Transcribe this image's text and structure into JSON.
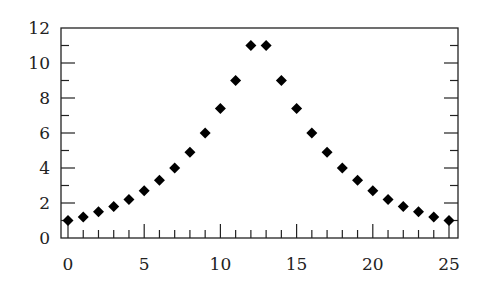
{
  "chart_data": {
    "type": "scatter",
    "title": "",
    "xlabel": "",
    "ylabel": "",
    "marker": "diamond",
    "marker_color": "#000000",
    "x": [
      0,
      1,
      2,
      3,
      4,
      5,
      6,
      7,
      8,
      9,
      10,
      11,
      12,
      13,
      14,
      15,
      16,
      17,
      18,
      19,
      20,
      21,
      22,
      23,
      24,
      25
    ],
    "y": [
      1.0,
      1.2,
      1.5,
      1.8,
      2.2,
      2.7,
      3.3,
      4.0,
      4.9,
      6.0,
      7.4,
      9.0,
      11.0,
      11.0,
      9.0,
      7.4,
      6.0,
      4.9,
      4.0,
      3.3,
      2.7,
      2.2,
      1.8,
      1.5,
      1.2,
      1.0
    ],
    "xlim": [
      -0.5,
      25.6
    ],
    "ylim": [
      0,
      12
    ],
    "x_ticks": [
      0,
      5,
      10,
      15,
      20,
      25
    ],
    "x_tick_labels": [
      "0",
      "5",
      "10",
      "15",
      "20",
      "25"
    ],
    "y_ticks": [
      0,
      2,
      4,
      6,
      8,
      10,
      12
    ],
    "y_tick_labels": [
      "0",
      "2",
      "4",
      "6",
      "8",
      "10",
      "12"
    ],
    "x_minor_ticks_step": 1,
    "y_minor_ticks_step": 1,
    "grid": false,
    "legend": null
  }
}
